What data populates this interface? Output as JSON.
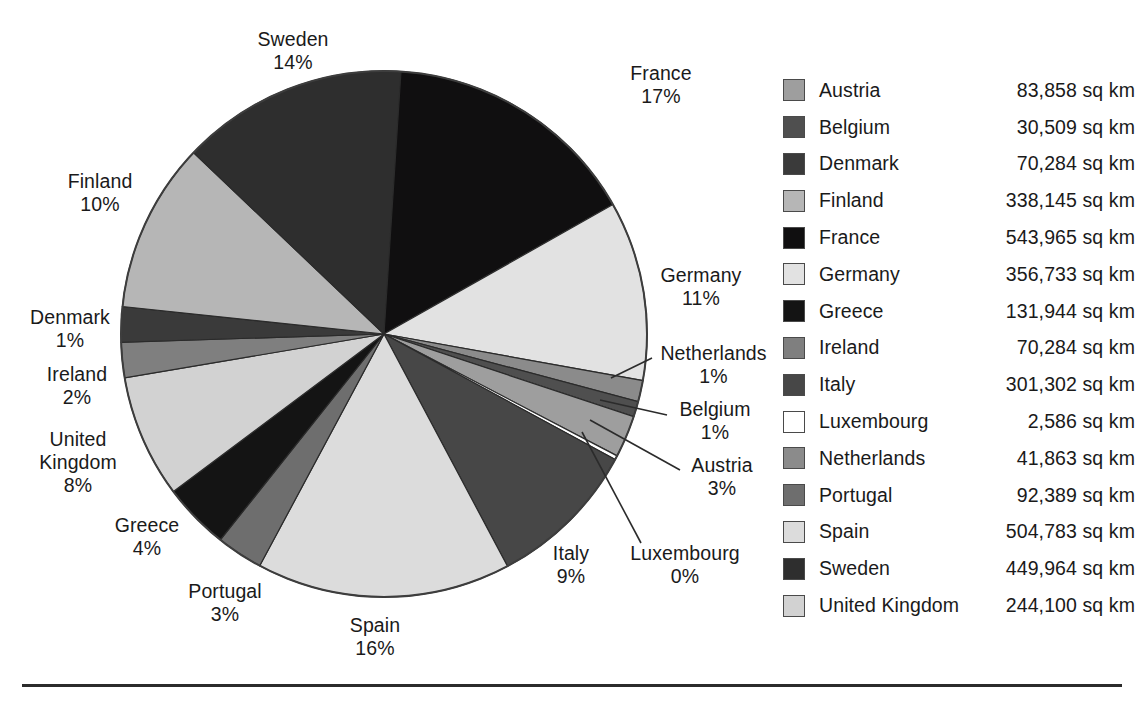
{
  "chart_data": {
    "type": "pie",
    "title": "",
    "unit": "sq km",
    "start_angle_deg": 0,
    "direction": "clockwise",
    "legend_position": "right",
    "grid": false,
    "categories": [
      "France",
      "Germany",
      "Netherlands",
      "Belgium",
      "Austria",
      "Luxembourg",
      "Italy",
      "Spain",
      "Portugal",
      "Greece",
      "United Kingdom",
      "Ireland",
      "Denmark",
      "Finland",
      "Sweden"
    ],
    "values": [
      543965,
      356733,
      41863,
      30509,
      83858,
      2586,
      301302,
      504783,
      92389,
      131944,
      244100,
      70284,
      70284,
      338145,
      449964
    ],
    "percents": [
      17,
      11,
      1,
      1,
      3,
      0,
      9,
      16,
      3,
      4,
      8,
      2,
      1,
      10,
      14
    ],
    "slices": [
      {
        "name": "France",
        "percent_label": "17%",
        "value_label": "543,965 sq km",
        "sweep_deg": 60.5,
        "color": "#100f10"
      },
      {
        "name": "Germany",
        "percent_label": "11%",
        "value_label": "356,733 sq km",
        "sweep_deg": 39.7,
        "color": "#e2e2e2"
      },
      {
        "name": "Netherlands",
        "percent_label": "1%",
        "value_label": "41,863 sq km",
        "sweep_deg": 4.7,
        "color": "#8b8b8b"
      },
      {
        "name": "Belgium",
        "percent_label": "1%",
        "value_label": "30,509 sq km",
        "sweep_deg": 3.4,
        "color": "#4f4f4f"
      },
      {
        "name": "Austria",
        "percent_label": "3%",
        "value_label": "83,858 sq km",
        "sweep_deg": 9.3,
        "color": "#9e9e9e"
      },
      {
        "name": "Luxembourg",
        "percent_label": "0%",
        "value_label": "2,586 sq km",
        "sweep_deg": 0.9,
        "color": "#ffffff"
      },
      {
        "name": "Italy",
        "percent_label": "9%",
        "value_label": "301,302 sq km",
        "sweep_deg": 33.5,
        "color": "#474747"
      },
      {
        "name": "Spain",
        "percent_label": "16%",
        "value_label": "504,783 sq km",
        "sweep_deg": 56.2,
        "color": "#dcdcdc"
      },
      {
        "name": "Portugal",
        "percent_label": "3%",
        "value_label": "92,389 sq km",
        "sweep_deg": 10.3,
        "color": "#6e6e6e"
      },
      {
        "name": "Greece",
        "percent_label": "4%",
        "value_label": "131,944 sq km",
        "sweep_deg": 14.7,
        "color": "#141414"
      },
      {
        "name": "United Kingdom",
        "percent_label": "8%",
        "value_label": "244,100 sq km",
        "sweep_deg": 27.2,
        "color": "#d2d2d2"
      },
      {
        "name": "Ireland",
        "percent_label": "2%",
        "value_label": "70,284 sq km",
        "sweep_deg": 7.8,
        "color": "#7f7f7f"
      },
      {
        "name": "Denmark",
        "percent_label": "1%",
        "value_label": "70,284 sq km",
        "sweep_deg": 7.8,
        "color": "#3a3a3a"
      },
      {
        "name": "Finland",
        "percent_label": "10%",
        "value_label": "338,145 sq km",
        "sweep_deg": 37.6,
        "color": "#b6b6b6"
      },
      {
        "name": "Sweden",
        "percent_label": "14%",
        "value_label": "449,964 sq km",
        "sweep_deg": 50.1,
        "color": "#2e2e2e"
      }
    ]
  },
  "callouts": {
    "sweden": {
      "name": "Sweden",
      "percent": "14%"
    },
    "france": {
      "name": "France",
      "percent": "17%"
    },
    "germany": {
      "name": "Germany",
      "percent": "11%"
    },
    "netherlands": {
      "name": "Netherlands",
      "percent": "1%"
    },
    "belgium": {
      "name": "Belgium",
      "percent": "1%"
    },
    "austria": {
      "name": "Austria",
      "percent": "3%"
    },
    "luxembourg": {
      "name": "Luxembourg",
      "percent": "0%"
    },
    "italy": {
      "name": "Italy",
      "percent": "9%"
    },
    "spain": {
      "name": "Spain",
      "percent": "16%"
    },
    "portugal": {
      "name": "Portugal",
      "percent": "3%"
    },
    "greece": {
      "name": "Greece",
      "percent": "4%"
    },
    "united_kingdom": {
      "name": "United",
      "name2": "Kingdom",
      "percent": "8%"
    },
    "ireland": {
      "name": "Ireland",
      "percent": "2%"
    },
    "denmark": {
      "name": "Denmark",
      "percent": "1%"
    },
    "finland": {
      "name": "Finland",
      "percent": "10%"
    }
  },
  "legend": {
    "rows": [
      {
        "label": "Austria",
        "value": "83,858 sq km",
        "color": "#9e9e9e"
      },
      {
        "label": "Belgium",
        "value": "30,509 sq km",
        "color": "#4f4f4f"
      },
      {
        "label": "Denmark",
        "value": "70,284 sq km",
        "color": "#3a3a3a"
      },
      {
        "label": "Finland",
        "value": "338,145 sq km",
        "color": "#b6b6b6"
      },
      {
        "label": "France",
        "value": "543,965 sq km",
        "color": "#100f10"
      },
      {
        "label": "Germany",
        "value": "356,733 sq km",
        "color": "#e2e2e2"
      },
      {
        "label": "Greece",
        "value": "131,944 sq km",
        "color": "#141414"
      },
      {
        "label": "Ireland",
        "value": "70,284 sq km",
        "color": "#7f7f7f"
      },
      {
        "label": "Italy",
        "value": "301,302 sq km",
        "color": "#474747"
      },
      {
        "label": "Luxembourg",
        "value": "2,586 sq km",
        "color": "#ffffff"
      },
      {
        "label": "Netherlands",
        "value": "41,863 sq km",
        "color": "#8b8b8b"
      },
      {
        "label": "Portugal",
        "value": "92,389 sq km",
        "color": "#6e6e6e"
      },
      {
        "label": "Spain",
        "value": "504,783 sq km",
        "color": "#dcdcdc"
      },
      {
        "label": "Sweden",
        "value": "449,964 sq km",
        "color": "#2e2e2e"
      },
      {
        "label": "United Kingdom",
        "value": "244,100 sq km",
        "color": "#d2d2d2"
      }
    ]
  }
}
